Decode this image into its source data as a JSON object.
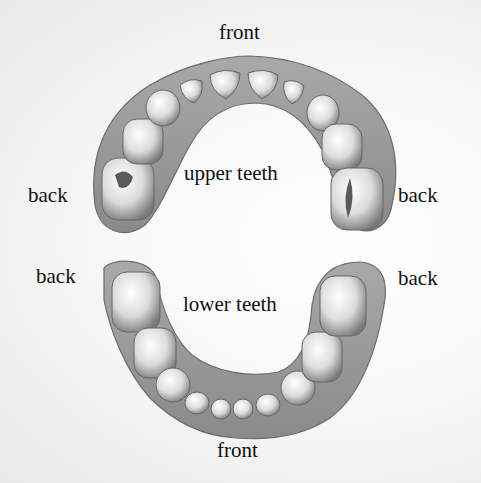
{
  "diagram": {
    "upper_arch": {
      "title": "upper teeth",
      "front_label": "front",
      "back_left_label": "back",
      "back_right_label": "back",
      "tooth_count": 10
    },
    "lower_arch": {
      "title": "lower teeth",
      "front_label": "front",
      "back_left_label": "back",
      "back_right_label": "back",
      "tooth_count": 10
    },
    "colors": {
      "gum": "#8f8f8f",
      "gum_highlight": "#b5b5b5",
      "tooth": "#e6e6e6",
      "tooth_shadow": "#6e6e6e",
      "text": "#111111"
    }
  }
}
